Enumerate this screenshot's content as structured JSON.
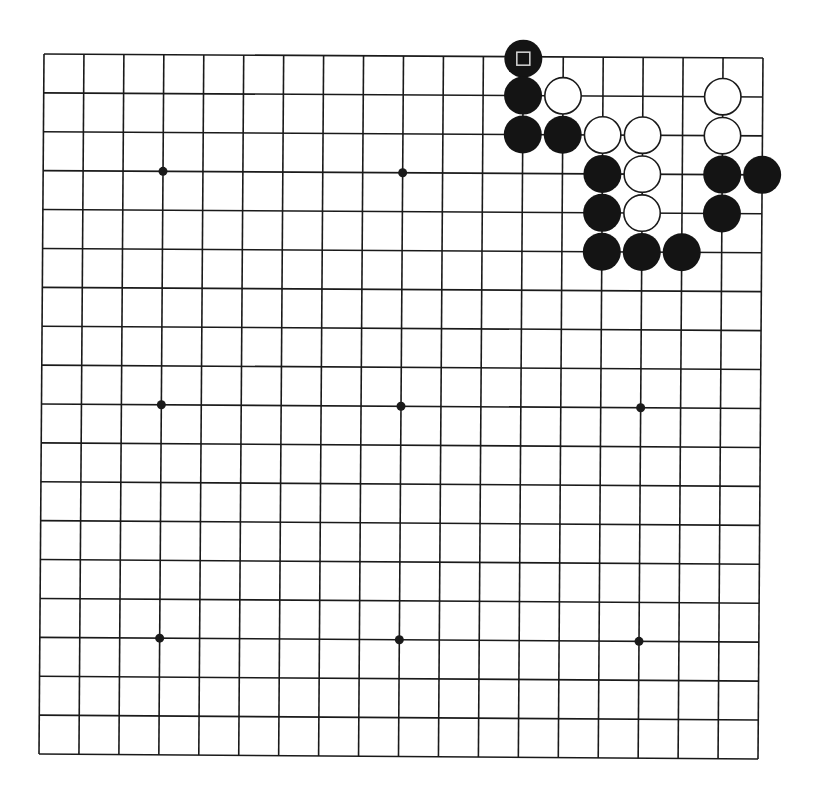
{
  "board": {
    "size": 19,
    "corners": {
      "top_left": [
        44,
        54
      ],
      "top_right": [
        763,
        58
      ],
      "bottom_left": [
        39,
        754
      ],
      "bottom_right": [
        758,
        759
      ]
    },
    "line_color": "#1a1a1a",
    "line_width": 1.6,
    "background": "#ffffff",
    "hoshi": [
      [
        4,
        4
      ],
      [
        4,
        10
      ],
      [
        4,
        16
      ],
      [
        10,
        4
      ],
      [
        10,
        10
      ],
      [
        10,
        16
      ],
      [
        16,
        4
      ],
      [
        16,
        10
      ],
      [
        16,
        16
      ]
    ],
    "hoshi_radius": 4.5,
    "stone_radius": 19
  },
  "stones": [
    {
      "color": "black",
      "col": 13,
      "row": 1,
      "marker": "square"
    },
    {
      "color": "black",
      "col": 13,
      "row": 2
    },
    {
      "color": "white",
      "col": 14,
      "row": 2
    },
    {
      "color": "white",
      "col": 18,
      "row": 2
    },
    {
      "color": "black",
      "col": 13,
      "row": 3
    },
    {
      "color": "black",
      "col": 14,
      "row": 3
    },
    {
      "color": "white",
      "col": 15,
      "row": 3
    },
    {
      "color": "white",
      "col": 16,
      "row": 3
    },
    {
      "color": "white",
      "col": 18,
      "row": 3
    },
    {
      "color": "black",
      "col": 15,
      "row": 4
    },
    {
      "color": "white",
      "col": 16,
      "row": 4
    },
    {
      "color": "black",
      "col": 18,
      "row": 4
    },
    {
      "color": "black",
      "col": 19,
      "row": 4
    },
    {
      "color": "black",
      "col": 15,
      "row": 5
    },
    {
      "color": "white",
      "col": 16,
      "row": 5
    },
    {
      "color": "black",
      "col": 18,
      "row": 5
    },
    {
      "color": "black",
      "col": 15,
      "row": 6
    },
    {
      "color": "black",
      "col": 16,
      "row": 6
    },
    {
      "color": "black",
      "col": 17,
      "row": 6
    }
  ],
  "colors": {
    "black_stone": "#141414",
    "white_stone_fill": "#ffffff",
    "white_stone_stroke": "#1a1a1a",
    "marker_stroke": "#d8d8d8"
  }
}
